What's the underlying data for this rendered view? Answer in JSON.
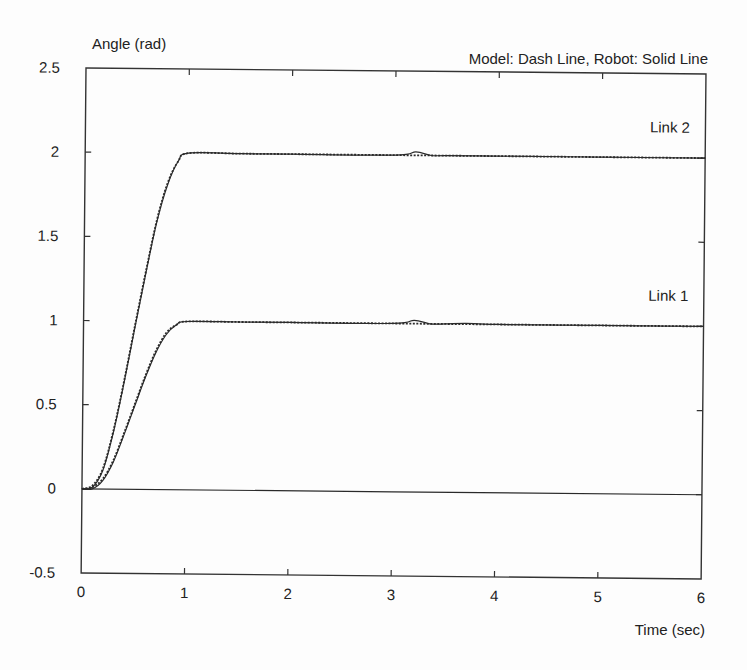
{
  "chart_data": {
    "type": "line",
    "title": "",
    "subtitle": "Model: Dash Line, Robot: Solid Line",
    "xlabel": "Time (sec)",
    "ylabel": "Angle (rad)",
    "xlim": [
      0,
      6
    ],
    "ylim": [
      -0.5,
      2.5
    ],
    "xticks": [
      "0",
      "1",
      "2",
      "3",
      "4",
      "5",
      "6"
    ],
    "yticks": [
      "-0.5",
      "0",
      "0.5",
      "1",
      "1.5",
      "2",
      "2.5"
    ],
    "grid": false,
    "legend": "none",
    "annotations": [
      {
        "text": "Link 2",
        "x": 5.85,
        "y": 2.15
      },
      {
        "text": "Link 1",
        "x": 5.85,
        "y": 1.15
      }
    ],
    "series": [
      {
        "name": "Link 2 (Model, dashed)",
        "style": "dash",
        "x": [
          0,
          0.1,
          0.2,
          0.3,
          0.4,
          0.5,
          0.6,
          0.7,
          0.8,
          0.9,
          1.0,
          1.5,
          2,
          3,
          4,
          5,
          6
        ],
        "y": [
          0,
          0.02,
          0.12,
          0.35,
          0.65,
          0.98,
          1.3,
          1.6,
          1.82,
          1.95,
          2.0,
          2.0,
          2.0,
          2.0,
          2.0,
          2.0,
          2.0
        ]
      },
      {
        "name": "Link 2 (Robot, solid)",
        "style": "solid",
        "x": [
          0,
          0.1,
          0.2,
          0.3,
          0.4,
          0.5,
          0.6,
          0.7,
          0.8,
          0.9,
          1.0,
          1.5,
          2,
          3.0,
          3.2,
          3.35,
          3.5,
          4,
          5,
          6
        ],
        "y": [
          0,
          0.01,
          0.11,
          0.34,
          0.64,
          0.97,
          1.29,
          1.59,
          1.81,
          1.95,
          2.0,
          2.0,
          2.0,
          2.0,
          2.02,
          2.0,
          2.0,
          2.0,
          2.0,
          2.0
        ]
      },
      {
        "name": "Link 1 (Model, dashed)",
        "style": "dash",
        "x": [
          0,
          0.1,
          0.2,
          0.3,
          0.4,
          0.5,
          0.6,
          0.7,
          0.8,
          0.9,
          1.0,
          1.5,
          2,
          3,
          4,
          5,
          6
        ],
        "y": [
          0,
          0.01,
          0.06,
          0.17,
          0.33,
          0.5,
          0.67,
          0.82,
          0.93,
          0.98,
          1.0,
          1.0,
          1.0,
          1.0,
          1.0,
          1.0,
          1.0
        ]
      },
      {
        "name": "Link 1 (Robot, solid)",
        "style": "solid",
        "x": [
          0,
          0.1,
          0.2,
          0.3,
          0.4,
          0.5,
          0.6,
          0.7,
          0.8,
          0.9,
          1.0,
          1.5,
          2,
          3.0,
          3.2,
          3.35,
          3.5,
          3.7,
          4,
          5,
          6
        ],
        "y": [
          0,
          0.0,
          0.05,
          0.16,
          0.32,
          0.49,
          0.66,
          0.81,
          0.92,
          0.98,
          1.0,
          1.0,
          1.0,
          1.0,
          1.02,
          1.0,
          1.0,
          1.005,
          1.0,
          1.0,
          1.0
        ]
      },
      {
        "name": "Zero reference",
        "style": "solid",
        "x": [
          0,
          6
        ],
        "y": [
          0,
          0
        ]
      }
    ]
  }
}
